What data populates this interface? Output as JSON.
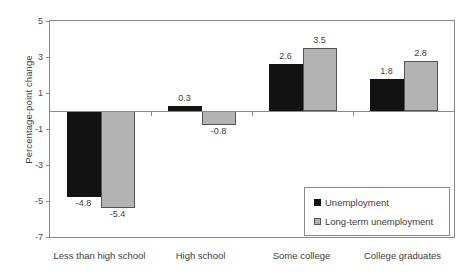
{
  "chart_data": {
    "type": "bar",
    "title": "",
    "subtitle": "",
    "xlabel": "",
    "ylabel": "Percentage-point change",
    "ylim": [
      -7,
      5
    ],
    "yticks": [
      5,
      3,
      1,
      -1,
      -3,
      -5,
      -7
    ],
    "ytick_labels": [
      "5",
      "3",
      "1",
      "-1",
      "-3",
      "-5",
      "-7"
    ],
    "grid": false,
    "legend_position": "inside-bottom-right",
    "categories": [
      "Less than high school",
      "High school",
      "Some college",
      "College graduates"
    ],
    "series": [
      {
        "name": "Unemployment",
        "color": "#121212",
        "values": [
          -4.8,
          0.3,
          2.6,
          1.8
        ],
        "labels": [
          "-4.8",
          "0.3",
          "2.6",
          "1.8"
        ]
      },
      {
        "name": "Long-term unemployment",
        "color": "#b3b3b3",
        "values": [
          -5.4,
          -0.8,
          3.5,
          2.8
        ],
        "labels": [
          "-5.4",
          "-0.8",
          "3.5",
          "2.8"
        ]
      }
    ]
  },
  "legend": {
    "items": [
      {
        "label": "Unemployment",
        "swatch": "black-square-icon"
      },
      {
        "label": "Long-term unemployment",
        "swatch": "gray-square-icon"
      }
    ]
  }
}
